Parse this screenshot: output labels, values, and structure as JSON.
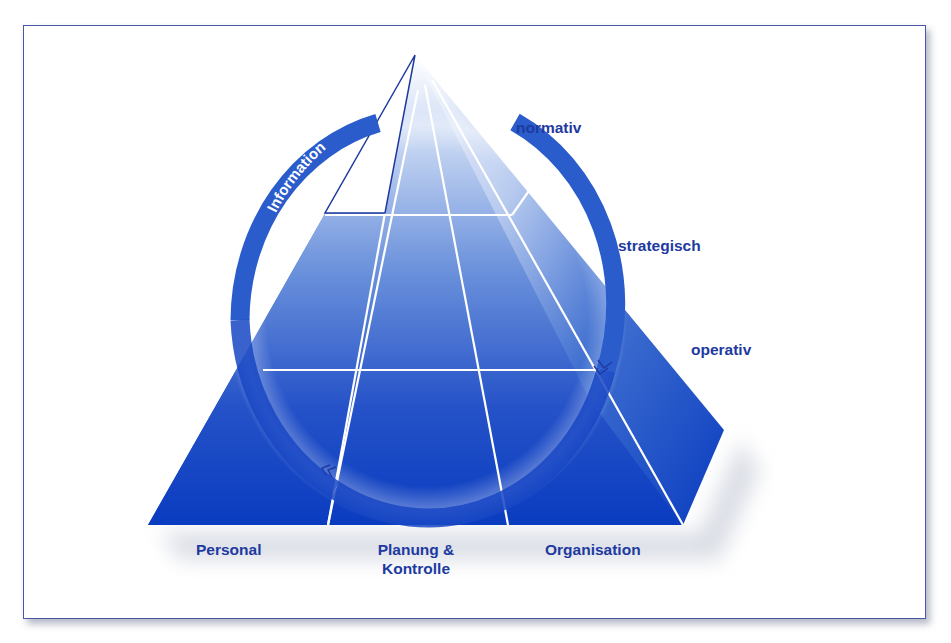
{
  "diagram": {
    "title": "",
    "ring_label": "Information",
    "levels": [
      {
        "id": "normativ",
        "label": "normativ"
      },
      {
        "id": "strategisch",
        "label": "strategisch"
      },
      {
        "id": "operativ",
        "label": "operativ"
      }
    ],
    "dimensions": [
      {
        "id": "personal",
        "label": "Personal"
      },
      {
        "id": "planung",
        "label_line1": "Planung &",
        "label_line2": "Kontrolle"
      },
      {
        "id": "organisation",
        "label": "Organisation"
      }
    ],
    "colors": {
      "primary_blue": "#0a3cc0",
      "mid_blue": "#3f6fd0",
      "light_blue": "#dfe8f8",
      "label_blue": "#1d3aa0",
      "frame_border": "#4a55a8",
      "grid_lines": "#ffffff"
    }
  }
}
